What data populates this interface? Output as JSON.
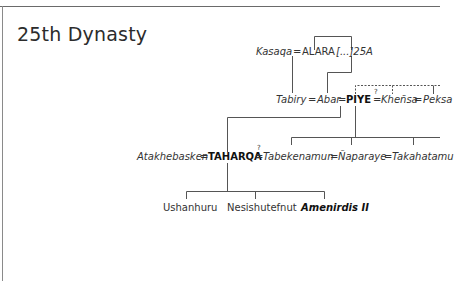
{
  "title": "25th Dynasty",
  "rows": {
    "row1": {
      "kasaqa": "Kasaqa",
      "eq1": "=",
      "alara": "ALARA",
      "unknown": "[...]25A"
    },
    "row2": {
      "tabiry": "Tabiry",
      "eq1": "=",
      "abar": "Abar",
      "eq2": "=",
      "piye": "PIYE",
      "eq3": "=",
      "uncertain_mark": "?",
      "khensa": "Kheñsa",
      "eq4": "=",
      "peksa": "Peksa"
    },
    "row3": {
      "atakhebasken": "Atakhebasken",
      "eq1": "=",
      "taharqa": "TAHARQA",
      "eq2": "=",
      "uncertain_mark": "?",
      "tabekenamun": "Tabekenamun",
      "eq3": "=",
      "naparaye": "Ñaparaye",
      "eq4": "=",
      "takahatamu": "Takahatamu"
    },
    "row4": {
      "children": [
        "Ushanhuru",
        "Nesishutefnut",
        "Amenirdis II"
      ]
    }
  },
  "colors": {
    "line": "#555555",
    "text": "#333333",
    "frame": "#6a6a6a"
  }
}
